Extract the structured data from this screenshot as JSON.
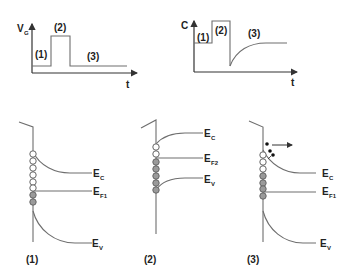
{
  "top_panels": {
    "gate_voltage": {
      "y_label": "V",
      "y_label_sub": "G",
      "x_label": "t",
      "phases": [
        "(1)",
        "(2)",
        "(3)"
      ]
    },
    "capacitance": {
      "y_label": "C",
      "x_label": "t",
      "phases": [
        "(1)",
        "(2)",
        "(3)"
      ]
    }
  },
  "band_diagrams": [
    {
      "label": "(1)",
      "levels": [
        {
          "name": "E",
          "sub": "C"
        },
        {
          "name": "E",
          "sub": "F1"
        },
        {
          "name": "E",
          "sub": "V"
        }
      ],
      "states": [
        "empty",
        "empty",
        "empty",
        "empty",
        "empty",
        "filled",
        "filled"
      ]
    },
    {
      "label": "(2)",
      "levels": [
        {
          "name": "E",
          "sub": "C"
        },
        {
          "name": "E",
          "sub": "F2"
        },
        {
          "name": "E",
          "sub": "V"
        }
      ],
      "states": [
        "empty",
        "empty",
        "filled",
        "filled",
        "filled",
        "filled",
        "filled"
      ]
    },
    {
      "label": "(3)",
      "levels": [
        {
          "name": "E",
          "sub": "C"
        },
        {
          "name": "E",
          "sub": "F1"
        },
        {
          "name": "E",
          "sub": "V"
        }
      ],
      "states": [
        "empty",
        "empty",
        "empty",
        "filled",
        "filled",
        "filled",
        "filled"
      ],
      "emitted_electrons": 3
    }
  ],
  "colors": {
    "line": "#6e6e6e",
    "axis": "#333333",
    "filled_state": "#9a9a9a",
    "empty_state": "#ffffff",
    "electron": "#111111"
  }
}
